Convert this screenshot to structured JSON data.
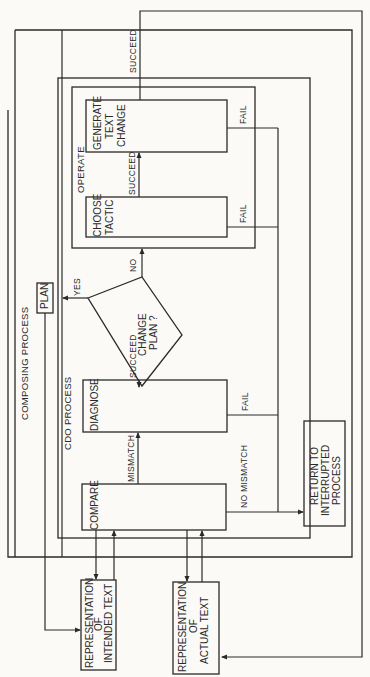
{
  "diagram": {
    "orientation": "rotated-90-ccw",
    "containers": {
      "composing_process": {
        "label": "COMPOSING PROCESS"
      },
      "cdo_process": {
        "label": "CDO PROCESS"
      },
      "operate": {
        "label": "OPERATE"
      }
    },
    "nodes": {
      "plan": {
        "label": "PLAN"
      },
      "compare": {
        "label": "COMPARE"
      },
      "diagnose": {
        "label": "DIAGNOSE"
      },
      "change_plan": {
        "line1": "CHANGE",
        "line2": "PLAN ?"
      },
      "choose_tactic": {
        "line1": "CHOOSE",
        "line2": "TACTIC"
      },
      "generate_text_change": {
        "line1": "GENERATE",
        "line2": "TEXT",
        "line3": "CHANGE"
      },
      "rep_intended_text": {
        "line1": "REPRESENTATION",
        "line2": "OF",
        "line3": "INTENDED TEXT"
      },
      "rep_actual_text": {
        "line1": "REPRESENTATION",
        "line2": "OF",
        "line3": "ACTUAL TEXT"
      },
      "return_to_interrupted": {
        "line1": "RETURN TO",
        "line2": "INTERRUPTED",
        "line3": "PROCESS"
      }
    },
    "edge_labels": {
      "mismatch": "MISMATCH",
      "no_mismatch": "NO MISMATCH",
      "diagnose_succeed": "SUCCEED",
      "diagnose_fail": "FAIL",
      "yes": "YES",
      "no": "NO",
      "tactic_succeed": "SUCCEED",
      "tactic_fail": "FAIL",
      "generate_succeed": "SUCCEED",
      "generate_fail": "FAIL"
    }
  }
}
